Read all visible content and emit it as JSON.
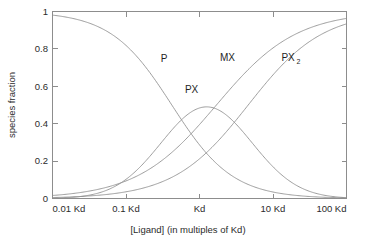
{
  "chart_data": {
    "type": "line",
    "title": "",
    "xlabel": "[Ligand] (in multiples of Kd)",
    "ylabel": "species fraction",
    "xscale": "log",
    "xlim": [
      0.01,
      100
    ],
    "ylim": [
      0,
      1
    ],
    "grid": false,
    "legend": "inline-labels",
    "xticks": [
      0.01,
      0.1,
      1,
      10,
      100
    ],
    "xticklabels": [
      "0.01 Kd",
      "0.1 Kd",
      "Kd",
      "10 Kd",
      "100 Kd"
    ],
    "yticks": [
      0,
      0.2,
      0.4,
      0.6,
      0.8,
      1
    ],
    "yticklabels": [
      "0",
      "0.2",
      "0.4",
      "0.6",
      "0.8",
      "1"
    ],
    "line_color": "#8d8d8d",
    "x": [
      0.01,
      0.0158,
      0.0251,
      0.0398,
      0.0631,
      0.1,
      0.158,
      0.251,
      0.398,
      0.631,
      1,
      1.58,
      2.51,
      3.98,
      6.31,
      10,
      15.8,
      25.1,
      39.8,
      63.1,
      100
    ],
    "series": [
      {
        "name": "P",
        "label": "P",
        "label_x": 0.33,
        "label_y": 0.73,
        "values": [
          0.98,
          0.969,
          0.952,
          0.926,
          0.888,
          0.835,
          0.762,
          0.668,
          0.556,
          0.436,
          0.32,
          0.22,
          0.142,
          0.087,
          0.051,
          0.029,
          0.016,
          0.009,
          0.005,
          0.003,
          0.002
        ]
      },
      {
        "name": "PX",
        "label": "PX",
        "label_x": 0.78,
        "label_y": 0.565,
        "values": [
          0.01,
          0.015,
          0.024,
          0.037,
          0.056,
          0.084,
          0.121,
          0.168,
          0.221,
          0.275,
          0.32,
          0.348,
          0.356,
          0.346,
          0.322,
          0.29,
          0.255,
          0.22,
          0.187,
          0.157,
          0.13
        ]
      },
      {
        "name": "MX",
        "label": "MX",
        "label_x": 2.4,
        "label_y": 0.735,
        "values": [
          0.01,
          0.016,
          0.024,
          0.037,
          0.056,
          0.081,
          0.117,
          0.164,
          0.223,
          0.289,
          0.36,
          0.432,
          0.502,
          0.567,
          0.627,
          0.681,
          0.731,
          0.777,
          0.821,
          0.862,
          0.9
        ]
      },
      {
        "name": "PX2",
        "label": "PX",
        "label_sub": "2",
        "label_x": 13.0,
        "label_y": 0.735,
        "values": [
          0.0,
          0.0,
          0.0,
          0.0,
          0.0,
          0.0,
          0.0,
          0.0,
          0.0,
          0.0,
          0.0,
          0.0,
          0.0,
          0.0,
          0.0,
          0.0,
          0.0,
          0.0,
          0.0,
          0.0,
          0.0
        ]
      }
    ],
    "px_peak": {
      "x": 1.25,
      "y": 0.49
    }
  }
}
